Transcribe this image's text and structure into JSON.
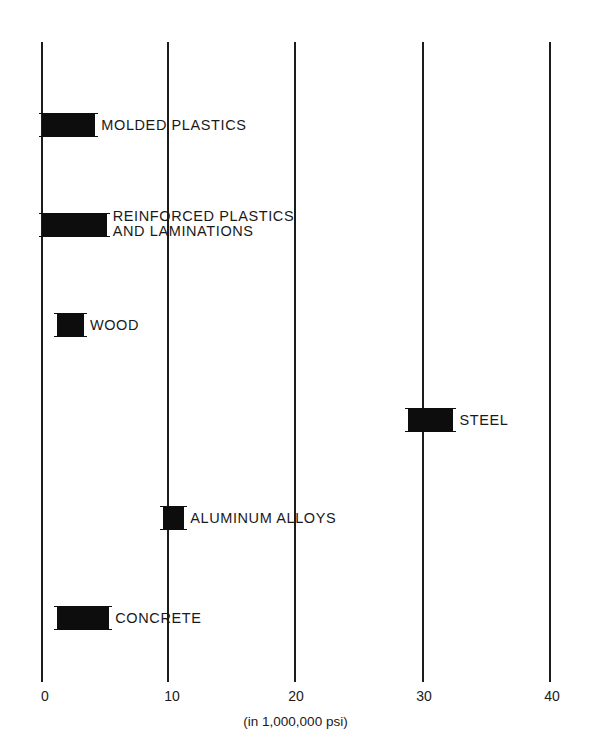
{
  "chart_data": {
    "type": "bar",
    "orientation": "horizontal-range",
    "title": "",
    "xlabel": "(in 1,000,000 psi)",
    "ylabel": "",
    "xlim": [
      0,
      40
    ],
    "x_ticks": [
      "0",
      "10",
      "20",
      "30",
      "40"
    ],
    "grid": true,
    "legend": null,
    "categories": [
      "MOLDED PLASTICS",
      "REINFORCED PLASTICS AND LAMINATIONS",
      "WOOD",
      "STEEL",
      "ALUMINUM ALLOYS",
      "CONCRETE"
    ],
    "series": [
      {
        "name": "Modulus of elasticity range",
        "ranges": [
          {
            "category": "MOLDED PLASTICS",
            "min": 0,
            "max": 4.2
          },
          {
            "category": "REINFORCED PLASTICS AND LAMINATIONS",
            "min": 0,
            "max": 5.1
          },
          {
            "category": "WOOD",
            "min": 1.2,
            "max": 3.3
          },
          {
            "category": "STEEL",
            "min": 28.8,
            "max": 32.4
          },
          {
            "category": "ALUMINUM ALLOYS",
            "min": 9.5,
            "max": 11.2
          },
          {
            "category": "CONCRETE",
            "min": 1.2,
            "max": 5.3
          }
        ]
      }
    ]
  },
  "bars": [
    {
      "label_line1": "MOLDED PLASTICS",
      "label_line2": "",
      "min": 0,
      "max": 4.2,
      "y": 113
    },
    {
      "label_line1": "REINFORCED PLASTICS",
      "label_line2": "AND LAMINATIONS",
      "min": 0,
      "max": 5.1,
      "y": 213
    },
    {
      "label_line1": "WOOD",
      "label_line2": "",
      "min": 1.2,
      "max": 3.3,
      "y": 313
    },
    {
      "label_line1": "STEEL",
      "label_line2": "",
      "min": 28.8,
      "max": 32.4,
      "y": 408
    },
    {
      "label_line1": "ALUMINUM ALLOYS",
      "label_line2": "",
      "min": 9.5,
      "max": 11.2,
      "y": 506
    },
    {
      "label_line1": "CONCRETE",
      "label_line2": "",
      "min": 1.2,
      "max": 5.3,
      "y": 606
    }
  ],
  "axis": {
    "ticks": [
      "0",
      "10",
      "20",
      "30",
      "40"
    ],
    "unit_label": "(in 1,000,000 psi)"
  }
}
